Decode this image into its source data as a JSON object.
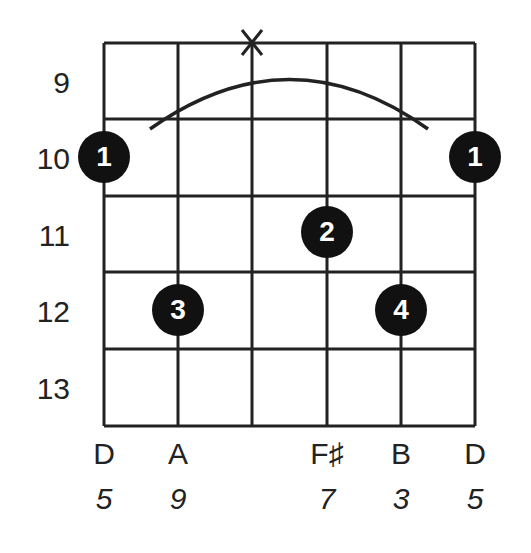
{
  "chord_diagram": {
    "frets": [
      "9",
      "10",
      "11",
      "12",
      "13"
    ],
    "strings": [
      {
        "note": "D",
        "interval": "5"
      },
      {
        "note": "A",
        "interval": "9"
      },
      {
        "note": "",
        "interval": ""
      },
      {
        "note": "F♯",
        "interval": "7"
      },
      {
        "note": "B",
        "interval": "3"
      },
      {
        "note": "D",
        "interval": "5"
      }
    ],
    "muted_marker": "X",
    "fingers": [
      {
        "finger": "1",
        "string": 1,
        "fret": "10"
      },
      {
        "finger": "1",
        "string": 6,
        "fret": "10"
      },
      {
        "finger": "2",
        "string": 4,
        "fret": "11"
      },
      {
        "finger": "3",
        "string": 2,
        "fret": "12"
      },
      {
        "finger": "4",
        "string": 5,
        "fret": "12"
      }
    ]
  }
}
